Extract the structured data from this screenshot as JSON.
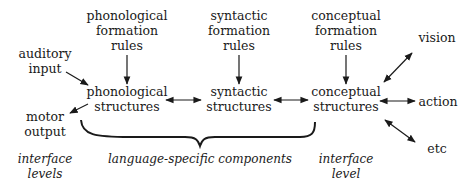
{
  "diagram": {
    "nodes": {
      "phon_rules": [
        "phonological",
        "formation",
        "rules"
      ],
      "syn_rules": [
        "syntactic",
        "formation",
        "rules"
      ],
      "conc_rules": [
        "conceptual",
        "formation",
        "rules"
      ],
      "auditory_input": [
        "auditory",
        "input"
      ],
      "motor_output": [
        "motor",
        "output"
      ],
      "phon_struct": [
        "phonological",
        "structures"
      ],
      "syn_struct": [
        "syntactic",
        "structures"
      ],
      "conc_struct": [
        "conceptual",
        "structures"
      ],
      "vision": [
        "vision"
      ],
      "action": [
        "action"
      ],
      "etc": [
        "etc"
      ]
    },
    "annotations": {
      "interface_levels": [
        "interface",
        "levels"
      ],
      "language_specific": [
        "language-specific components"
      ],
      "interface_level": [
        "interface",
        "level"
      ]
    },
    "edges": [
      {
        "from": "phon_rules",
        "to": "phon_struct",
        "type": "arrow"
      },
      {
        "from": "syn_rules",
        "to": "syn_struct",
        "type": "arrow"
      },
      {
        "from": "conc_rules",
        "to": "conc_struct",
        "type": "arrow"
      },
      {
        "from": "auditory_input",
        "to": "phon_struct",
        "type": "arrow"
      },
      {
        "from": "phon_struct",
        "to": "motor_output",
        "type": "arrow"
      },
      {
        "from": "phon_struct",
        "to": "syn_struct",
        "type": "double-arrow"
      },
      {
        "from": "syn_struct",
        "to": "conc_struct",
        "type": "double-arrow"
      },
      {
        "from": "conc_struct",
        "to": "vision",
        "type": "double-arrow"
      },
      {
        "from": "conc_struct",
        "to": "action",
        "type": "double-arrow"
      },
      {
        "from": "conc_struct",
        "to": "etc",
        "type": "double-arrow"
      }
    ]
  }
}
